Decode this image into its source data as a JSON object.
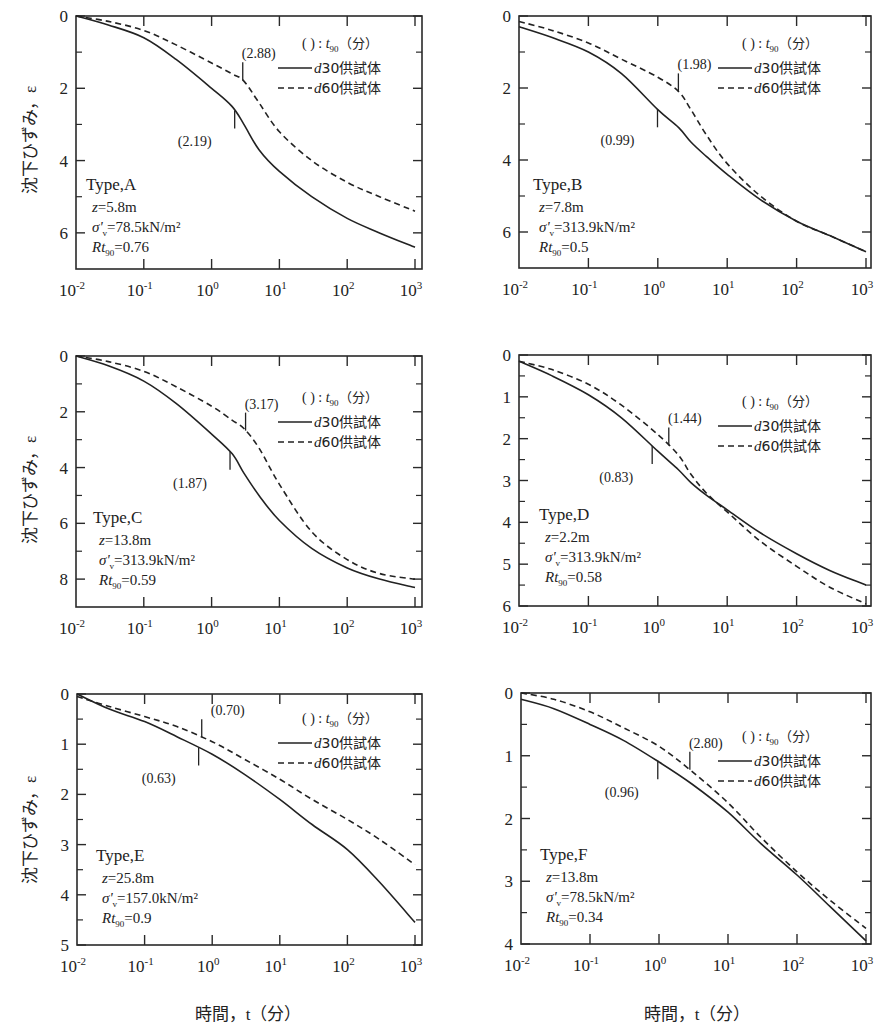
{
  "figure": {
    "ylabel": "沈下ひずみ，ε",
    "xlabel": "時間，t（分）",
    "xlabel_time": "時間，",
    "xlabel_t": "t",
    "xlabel_unit": "（分）",
    "legend": {
      "title_paren": "( ) :",
      "title_t": "t",
      "title_sub": "90",
      "title_unit": "（分）",
      "d30": "d30供試体",
      "d60": "d60供試体",
      "d30_italic": "d",
      "d30_rest": "30供試体",
      "d60_italic": "d",
      "d60_rest": "60供試体"
    },
    "x_ticks": [
      "10",
      "10",
      "10",
      "10",
      "10",
      "10"
    ],
    "x_tick_exps": [
      "-2",
      "-1",
      "0",
      "1",
      "2",
      "3"
    ]
  },
  "chart_data": [
    {
      "type": "line",
      "title": "Type,A",
      "params": {
        "z": "z=5.8m",
        "sigma": "=78.5kN/m²",
        "rt": "=0.76"
      },
      "xscale": "log",
      "xlim": [
        0.01,
        1000
      ],
      "ylim": [
        0,
        7
      ],
      "y_inverted": true,
      "yticks": [
        0,
        2,
        4,
        6
      ],
      "yticks_minor": [
        1,
        3,
        5
      ],
      "xlabel": "時間，t（分）",
      "ylabel": "沈下ひずみ，ε",
      "x": [
        0.01,
        0.03,
        0.1,
        0.3,
        1,
        2,
        3,
        5,
        10,
        30,
        100,
        300,
        1000
      ],
      "series": [
        {
          "name": "d30供試体",
          "style": "solid",
          "t90": "(2.19)",
          "t90_x": 2.19,
          "values": [
            0.0,
            0.25,
            0.6,
            1.2,
            2.0,
            2.5,
            3.0,
            3.7,
            4.3,
            5.0,
            5.6,
            6.0,
            6.4
          ]
        },
        {
          "name": "d60供試体",
          "style": "dashed",
          "t90": "(2.88)",
          "t90_x": 2.88,
          "values": [
            0.0,
            0.15,
            0.4,
            0.8,
            1.3,
            1.6,
            1.8,
            2.4,
            3.2,
            4.0,
            4.6,
            5.0,
            5.4
          ]
        }
      ],
      "legend_position": "upper right"
    },
    {
      "type": "line",
      "title": "Type,B",
      "params": {
        "z": "z=7.8m",
        "sigma": "=313.9kN/m²",
        "rt": "=0.5"
      },
      "xscale": "log",
      "xlim": [
        0.01,
        1000
      ],
      "ylim": [
        0,
        7
      ],
      "y_inverted": true,
      "yticks": [
        0,
        2,
        4,
        6
      ],
      "yticks_minor": [
        1,
        3,
        5
      ],
      "x": [
        0.01,
        0.03,
        0.1,
        0.3,
        1,
        2,
        3,
        5,
        10,
        30,
        100,
        300,
        1000
      ],
      "series": [
        {
          "name": "d30供試体",
          "style": "solid",
          "t90": "(0.99)",
          "t90_x": 0.99,
          "values": [
            0.3,
            0.6,
            1.0,
            1.6,
            2.6,
            3.1,
            3.5,
            3.9,
            4.4,
            5.1,
            5.7,
            6.1,
            6.55
          ]
        },
        {
          "name": "d60供試体",
          "style": "dashed",
          "t90": "(1.98)",
          "t90_x": 1.98,
          "values": [
            0.15,
            0.4,
            0.75,
            1.2,
            1.7,
            2.1,
            2.6,
            3.3,
            4.1,
            5.0,
            5.7,
            6.1,
            6.55
          ]
        }
      ],
      "legend_position": "upper right"
    },
    {
      "type": "line",
      "title": "Type,C",
      "params": {
        "z": "z=13.8m",
        "sigma": "=313.9kN/m²",
        "rt": "=0.59"
      },
      "xscale": "log",
      "xlim": [
        0.01,
        1000
      ],
      "ylim": [
        0,
        9
      ],
      "y_inverted": true,
      "yticks": [
        0,
        2,
        4,
        6,
        8
      ],
      "yticks_minor": [
        1,
        3,
        5,
        7
      ],
      "x": [
        0.01,
        0.03,
        0.1,
        0.3,
        1,
        2,
        3,
        5,
        10,
        30,
        100,
        300,
        1000
      ],
      "series": [
        {
          "name": "d30供試体",
          "style": "solid",
          "t90": "(1.87)",
          "t90_x": 1.87,
          "values": [
            0.0,
            0.35,
            0.9,
            1.7,
            2.8,
            3.5,
            4.2,
            5.0,
            5.9,
            6.9,
            7.6,
            8.0,
            8.3
          ]
        },
        {
          "name": "d60供試体",
          "style": "dashed",
          "t90": "(3.17)",
          "t90_x": 3.17,
          "values": [
            0.0,
            0.2,
            0.55,
            1.1,
            1.8,
            2.3,
            2.6,
            3.3,
            4.6,
            6.3,
            7.3,
            7.8,
            8.0
          ]
        }
      ],
      "legend_position": "upper right"
    },
    {
      "type": "line",
      "title": "Type,D",
      "params": {
        "z": "z=2.2m",
        "sigma": "=313.9kN/m²",
        "rt": "=0.58"
      },
      "xscale": "log",
      "xlim": [
        0.01,
        1000
      ],
      "ylim": [
        0,
        6
      ],
      "y_inverted": true,
      "yticks": [
        0,
        1,
        2,
        3,
        4,
        5,
        6
      ],
      "yticks_minor": [
        0.5,
        1.5,
        2.5,
        3.5,
        4.5,
        5.5
      ],
      "x": [
        0.01,
        0.03,
        0.1,
        0.3,
        1,
        2,
        3,
        5,
        10,
        30,
        100,
        300,
        1000
      ],
      "series": [
        {
          "name": "d30供試体",
          "style": "solid",
          "t90": "(0.83)",
          "t90_x": 0.83,
          "values": [
            0.15,
            0.5,
            0.95,
            1.5,
            2.3,
            2.75,
            3.05,
            3.35,
            3.7,
            4.25,
            4.75,
            5.15,
            5.5
          ]
        },
        {
          "name": "d60供試体",
          "style": "dashed",
          "t90": "(1.44)",
          "t90_x": 1.44,
          "values": [
            0.15,
            0.35,
            0.7,
            1.2,
            1.9,
            2.4,
            2.85,
            3.3,
            3.75,
            4.45,
            5.05,
            5.55,
            5.95
          ]
        }
      ],
      "legend_position": "upper right"
    },
    {
      "type": "line",
      "title": "Type,E",
      "params": {
        "z": "z=25.8m",
        "sigma": "=157.0kN/m²",
        "rt": "=0.9"
      },
      "xscale": "log",
      "xlim": [
        0.01,
        1000
      ],
      "ylim": [
        0,
        5
      ],
      "y_inverted": true,
      "yticks": [
        0,
        1,
        2,
        3,
        4,
        5
      ],
      "yticks_minor": [
        0.5,
        1.5,
        2.5,
        3.5,
        4.5
      ],
      "x": [
        0.01,
        0.03,
        0.1,
        0.3,
        1,
        3,
        10,
        30,
        100,
        300,
        1000
      ],
      "series": [
        {
          "name": "d30供試体",
          "style": "solid",
          "t90": "(0.63)",
          "t90_x": 0.63,
          "values": [
            0.0,
            0.3,
            0.55,
            0.85,
            1.2,
            1.6,
            2.1,
            2.6,
            3.1,
            3.75,
            4.55
          ]
        },
        {
          "name": "d60供試体",
          "style": "dashed",
          "t90": "(0.70)",
          "t90_x": 0.7,
          "values": [
            0.05,
            0.25,
            0.45,
            0.65,
            0.95,
            1.3,
            1.7,
            2.1,
            2.5,
            2.9,
            3.4
          ]
        }
      ],
      "legend_position": "upper right"
    },
    {
      "type": "line",
      "title": "Type,F",
      "params": {
        "z": "z=13.8m",
        "sigma": "=78.5kN/m²",
        "rt": "=0.34"
      },
      "xscale": "log",
      "xlim": [
        0.01,
        1000
      ],
      "ylim": [
        0,
        4
      ],
      "y_inverted": true,
      "yticks": [
        0,
        1,
        2,
        3,
        4
      ],
      "yticks_minor": [
        0.5,
        1.5,
        2.5,
        3.5
      ],
      "x": [
        0.01,
        0.03,
        0.1,
        0.3,
        1,
        3,
        10,
        30,
        100,
        300,
        1000
      ],
      "series": [
        {
          "name": "d30供試体",
          "style": "solid",
          "t90": "(0.96)",
          "t90_x": 0.96,
          "values": [
            0.1,
            0.25,
            0.5,
            0.75,
            1.1,
            1.45,
            1.9,
            2.4,
            2.9,
            3.4,
            3.95
          ]
        },
        {
          "name": "d60供試体",
          "style": "dashed",
          "t90": "(2.80)",
          "t90_x": 2.8,
          "values": [
            0.0,
            0.1,
            0.3,
            0.55,
            0.85,
            1.25,
            1.75,
            2.3,
            2.85,
            3.3,
            3.75
          ]
        }
      ],
      "legend_position": "upper right"
    }
  ]
}
